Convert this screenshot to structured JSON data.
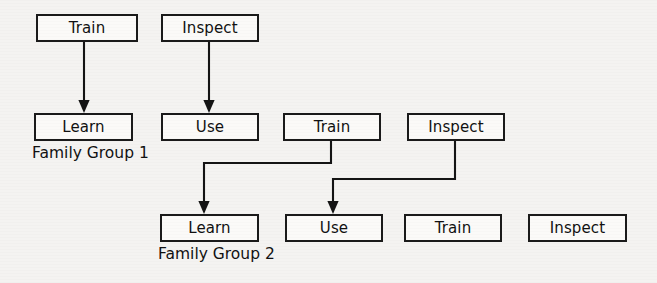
{
  "diagram": {
    "background_color": "#f4f3f1",
    "stroke_color": "#141414",
    "box_fill_color": "#fbfaf8",
    "rows": [
      {
        "name": "row-1",
        "nodes": [
          {
            "label": "Train",
            "x": 36,
            "y": 14,
            "w": 102,
            "h": 28
          },
          {
            "label": "Inspect",
            "x": 161,
            "y": 14,
            "w": 98,
            "h": 28
          }
        ]
      },
      {
        "name": "row-2",
        "nodes": [
          {
            "label": "Learn",
            "x": 34,
            "y": 113,
            "w": 99,
            "h": 28
          },
          {
            "label": "Use",
            "x": 161,
            "y": 113,
            "w": 98,
            "h": 28
          },
          {
            "label": "Train",
            "x": 283,
            "y": 113,
            "w": 98,
            "h": 28
          },
          {
            "label": "Inspect",
            "x": 407,
            "y": 113,
            "w": 98,
            "h": 28
          }
        ]
      },
      {
        "name": "row-3",
        "nodes": [
          {
            "label": "Learn",
            "x": 160,
            "y": 214,
            "w": 99,
            "h": 28
          },
          {
            "label": "Use",
            "x": 285,
            "y": 214,
            "w": 98,
            "h": 28
          },
          {
            "label": "Train",
            "x": 404,
            "y": 214,
            "w": 98,
            "h": 28
          },
          {
            "label": "Inspect",
            "x": 528,
            "y": 214,
            "w": 99,
            "h": 28
          }
        ]
      }
    ],
    "group_labels": [
      {
        "text": "Family Group 1",
        "x": 32,
        "y": 146
      },
      {
        "text": "Family Group 2",
        "x": 158,
        "y": 247
      }
    ],
    "connectors": [
      {
        "name": "train-to-learn",
        "kind": "straight-down",
        "from": "row-1 Train",
        "to": "row-2 Learn",
        "points": [
          [
            84,
            42
          ],
          [
            84,
            108
          ]
        ]
      },
      {
        "name": "inspect-to-use",
        "kind": "straight-down",
        "from": "row-1 Inspect",
        "to": "row-2 Use",
        "points": [
          [
            209,
            42
          ],
          [
            209,
            108
          ]
        ]
      },
      {
        "name": "train2-to-learn3",
        "kind": "elbow-left-down",
        "from": "row-2 Train",
        "to": "row-3 Learn",
        "points": [
          [
            331,
            141
          ],
          [
            331,
            163
          ],
          [
            204,
            163
          ],
          [
            204,
            209
          ]
        ]
      },
      {
        "name": "inspect2-to-use3",
        "kind": "elbow-left-down",
        "from": "row-2 Inspect",
        "to": "row-3 Use",
        "points": [
          [
            455,
            141
          ],
          [
            455,
            179
          ],
          [
            333,
            179
          ],
          [
            333,
            209
          ]
        ]
      }
    ]
  }
}
